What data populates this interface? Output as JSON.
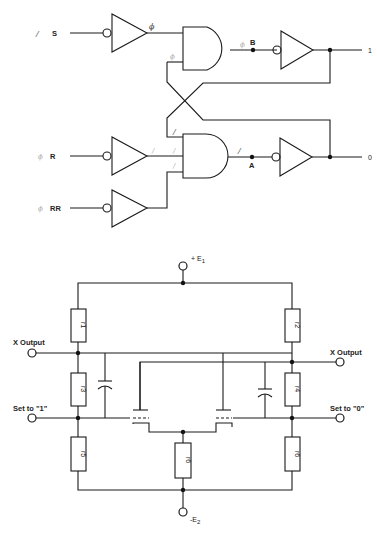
{
  "logic_circuit": {
    "inputs": [
      {
        "name": "S",
        "annotation": "/"
      },
      {
        "name": "R",
        "annotation": "ϕ"
      },
      {
        "name": "RR",
        "annotation": "ϕ"
      }
    ],
    "nodes": {
      "upper": "B",
      "lower": "A"
    },
    "outputs": {
      "upper": "1",
      "lower": "0"
    },
    "annotations": {
      "s_buffer_out": "ϕ",
      "upper_gate_in2": "ϕ",
      "upper_gate_out": "ϕ",
      "lower_gate_in1": "/",
      "lower_gate_in2": "/",
      "lower_gate_in3": "/",
      "lower_gate_out": "/",
      "r_buffer_out": "/"
    }
  },
  "analog_circuit": {
    "supply_pos": {
      "sign": "+",
      "symbol": "E",
      "subscript": "1"
    },
    "supply_neg": {
      "sign": "-",
      "symbol": "E",
      "subscript": "2"
    },
    "left_output": "X Output",
    "right_output": "X Output",
    "left_set": "Set to \"1\"",
    "right_set": "Set to \"0\"",
    "resistors": {
      "r1": "r1",
      "r2": "r2",
      "r3": "r3",
      "r4": "r4",
      "r5": "r5",
      "r6_mid": "r6",
      "r6_right": "r6"
    }
  }
}
